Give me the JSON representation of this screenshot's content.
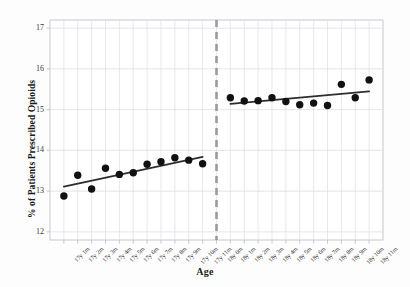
{
  "chart_data": {
    "type": "scatter",
    "title": "",
    "xlabel": "Age",
    "ylabel": "% of Patients Prescribed Opioids",
    "ylim": [
      11.8,
      17.2
    ],
    "yticks": [
      12,
      13,
      14,
      15,
      16,
      17
    ],
    "grid": true,
    "legend": "none",
    "categories": [
      "17y 1m",
      "17y 2m",
      "17y 3m",
      "17y 4m",
      "17y 5m",
      "17y 6m",
      "17y 7m",
      "17y 8m",
      "17y 9m",
      "17y 10m",
      "17y 11m",
      "18y 0m",
      "18y 1m",
      "18y 2m",
      "18y 3m",
      "18y 4m",
      "18y 5m",
      "18y 6m",
      "18y 7m",
      "18y 8m",
      "18y 9m",
      "18y 10m",
      "18y 11m"
    ],
    "values": [
      12.88,
      13.39,
      13.05,
      13.56,
      13.41,
      13.45,
      13.66,
      13.72,
      13.82,
      13.76,
      13.67,
      null,
      15.29,
      15.21,
      15.22,
      15.29,
      15.2,
      15.12,
      15.16,
      15.1,
      15.62,
      15.29,
      15.73
    ],
    "series": [
      {
        "name": "Before 18th birthday",
        "x": [
          "17y 1m",
          "17y 2m",
          "17y 3m",
          "17y 4m",
          "17y 5m",
          "17y 6m",
          "17y 7m",
          "17y 8m",
          "17y 9m",
          "17y 10m",
          "17y 11m"
        ],
        "values": [
          12.88,
          13.39,
          13.05,
          13.56,
          13.41,
          13.45,
          13.66,
          13.72,
          13.82,
          13.76,
          13.67
        ]
      },
      {
        "name": "On/after 18th birthday",
        "x": [
          "18y 1m",
          "18y 2m",
          "18y 3m",
          "18y 4m",
          "18y 5m",
          "18y 6m",
          "18y 7m",
          "18y 8m",
          "18y 9m",
          "18y 10m",
          "18y 11m"
        ],
        "values": [
          15.29,
          15.21,
          15.22,
          15.29,
          15.2,
          15.12,
          15.16,
          15.1,
          15.62,
          15.29,
          15.73
        ]
      }
    ],
    "fit_lines": [
      {
        "name": "left-fit",
        "x_start": "17y 1m",
        "x_end": "17y 11m",
        "y_start": 13.11,
        "y_end": 13.84
      },
      {
        "name": "right-fit",
        "x_start": "18y 1m",
        "x_end": "18y 11m",
        "y_start": 15.14,
        "y_end": 15.45
      }
    ],
    "discontinuity": {
      "at": "18y 0m",
      "style": "dashed",
      "color": "#9a9a9a"
    },
    "marker": {
      "shape": "circle",
      "color": "#111111",
      "size": 5.6
    },
    "line_color": "#2d2d2d",
    "grid_color": "#d8d8e2",
    "axis_color": "#b9b9c4"
  }
}
